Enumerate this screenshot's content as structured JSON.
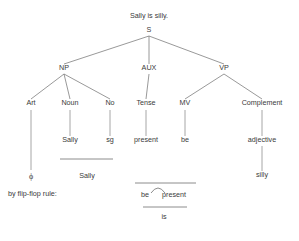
{
  "figure": {
    "title": "Sally is silly.",
    "note": "by flip-flop rule:"
  },
  "tree": {
    "root": {
      "label": "S",
      "x": 149,
      "y": 32
    },
    "level1": [
      {
        "label": "NP",
        "x": 64,
        "y": 70
      },
      {
        "label": "AUX",
        "x": 149,
        "y": 70
      },
      {
        "label": "VP",
        "x": 224,
        "y": 70
      }
    ],
    "level2": [
      {
        "label": "Art",
        "x": 31,
        "y": 105
      },
      {
        "label": "Noun",
        "x": 70,
        "y": 105
      },
      {
        "label": "No",
        "x": 110,
        "y": 105
      },
      {
        "label": "Tense",
        "x": 146,
        "y": 105
      },
      {
        "label": "MV",
        "x": 185,
        "y": 105
      },
      {
        "label": "Complement",
        "x": 262,
        "y": 105
      }
    ],
    "level3": [
      {
        "label": "Sally",
        "x": 70,
        "y": 142
      },
      {
        "label": "sg",
        "x": 110,
        "y": 142
      },
      {
        "label": "present",
        "x": 146,
        "y": 142
      },
      {
        "label": "be",
        "x": 185,
        "y": 142
      },
      {
        "label": "adjective",
        "x": 262,
        "y": 142
      }
    ],
    "level4": [
      {
        "label": "silly",
        "x": 262,
        "y": 177
      }
    ]
  },
  "derivation": {
    "null_article": "ϕ",
    "np_collapse": "Sally",
    "flipflop": {
      "left": "be",
      "right": "present",
      "result": "is"
    }
  },
  "colors": {
    "ink": "#3a3a3a",
    "line": "#777777",
    "background": "#ffffff"
  }
}
